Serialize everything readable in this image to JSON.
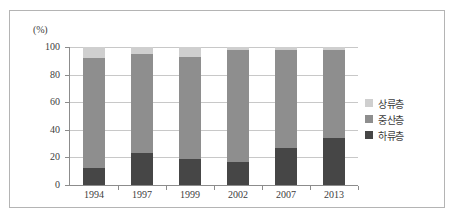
{
  "chart_data": {
    "type": "bar",
    "subtype": "stacked-100-percent",
    "title": "",
    "xlabel": "",
    "ylabel": "(%)",
    "unit_label": "(%)",
    "ylim": [
      0,
      100
    ],
    "yticks": [
      0,
      20,
      40,
      60,
      80,
      100
    ],
    "ytick_labels": [
      "0",
      "20",
      "40",
      "60",
      "80",
      "100"
    ],
    "grid": true,
    "legend_position": "right",
    "categories": [
      "1994",
      "1997",
      "1999",
      "2002",
      "2007",
      "2013"
    ],
    "series": [
      {
        "name": "하류층",
        "key": "lower",
        "color": "#464646",
        "values": [
          12,
          23,
          19,
          17,
          27,
          34
        ]
      },
      {
        "name": "중산층",
        "key": "middle",
        "color": "#8e8e8e",
        "values": [
          80,
          72,
          74,
          81,
          71,
          64
        ]
      },
      {
        "name": "상류층",
        "key": "upper",
        "color": "#cfcfcf",
        "values": [
          8,
          5,
          7,
          2,
          2,
          2
        ]
      }
    ],
    "legend_entries": [
      {
        "label": "상류층",
        "color": "#cfcfcf"
      },
      {
        "label": "중산층",
        "color": "#8e8e8e"
      },
      {
        "label": "하류층",
        "color": "#464646"
      }
    ]
  },
  "colors": {
    "upper": "#cfcfcf",
    "middle": "#8e8e8e",
    "lower": "#464646",
    "grid": "#c8c8c8",
    "axis": "#8c8c8c",
    "frame": "#b4b4b4",
    "text": "#3d3d3d",
    "background": "#ffffff"
  }
}
